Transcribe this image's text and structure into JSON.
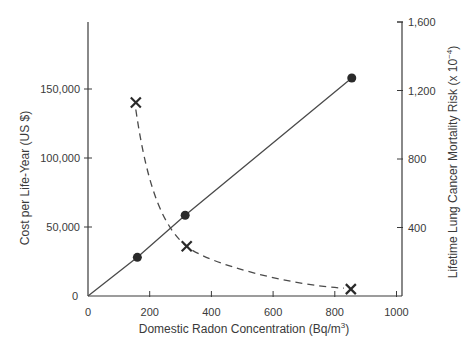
{
  "chart_data": {
    "type": "line",
    "title": "",
    "xlabel": "Domestic Radon Concentration (Bq/m",
    "xlabel_sup": "3",
    "xlabel_end": ")",
    "ylabel_left": "Cost per Life-Year (US $)",
    "ylabel_right": "Lifetime Lung Cancer Mortality Risk (x 10",
    "ylabel_right_sup": "−4",
    "ylabel_right_end": ")",
    "xlim": [
      0,
      1000
    ],
    "ylim_left": [
      0,
      190000
    ],
    "ylim_right": [
      0,
      1600
    ],
    "x_ticks": [
      "0",
      "200",
      "400",
      "600",
      "800",
      "1000"
    ],
    "x_tick_values": [
      0,
      200,
      400,
      600,
      800,
      1000
    ],
    "y_left_ticks": [
      "0",
      "50,000",
      "100,000",
      "150,000"
    ],
    "y_left_tick_values": [
      0,
      50000,
      100000,
      150000
    ],
    "y_right_ticks": [
      "400",
      "800",
      "1,200",
      "1,600"
    ],
    "y_right_tick_values": [
      400,
      800,
      1200,
      1600
    ],
    "grid": false,
    "legend": null,
    "series": [
      {
        "name": "Cost per Life-Year",
        "axis": "left",
        "marker": "circle",
        "line": "solid",
        "line_from_origin": true,
        "x": [
          160,
          315,
          855
        ],
        "values": [
          28000,
          58500,
          158000
        ]
      },
      {
        "name": "Lifetime Lung Cancer Mortality Risk",
        "axis": "right",
        "marker": "x",
        "line": "dashed",
        "x": [
          155,
          320,
          852
        ],
        "values": [
          1130,
          290,
          40
        ]
      }
    ]
  },
  "colors": {
    "axis": "#3a3a3a",
    "line": "#4a4a4a",
    "marker": "#2a2a2a",
    "text": "#3a3a3a"
  }
}
